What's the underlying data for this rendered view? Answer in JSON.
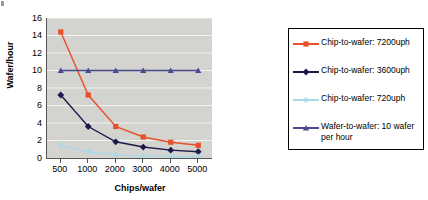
{
  "chart_data": {
    "type": "line",
    "title": "",
    "xlabel": "Chips/wafer",
    "ylabel": "Wafer/hour",
    "categories": [
      "500",
      "1000",
      "2000",
      "3000",
      "4000",
      "5000"
    ],
    "ylim": [
      0,
      16
    ],
    "yticks": [
      "0",
      "2",
      "4",
      "6",
      "8",
      "10",
      "12",
      "14",
      "16"
    ],
    "grid": true,
    "legend_position": "right",
    "series": [
      {
        "name": "Chip-to-wafer: 7200uph",
        "color": "#E8502A",
        "marker": "square",
        "values": [
          14.4,
          7.2,
          3.6,
          2.4,
          1.8,
          1.45
        ]
      },
      {
        "name": "Chip-to-wafer: 3600uph",
        "color": "#1B1B4B",
        "marker": "diamond",
        "values": [
          7.2,
          3.6,
          1.85,
          1.25,
          0.9,
          0.72
        ]
      },
      {
        "name": "Chip-to-wafer: 720uph",
        "color": "#A8D9E8",
        "marker": "star",
        "values": [
          1.45,
          0.72,
          0.36,
          0.24,
          0.18,
          0.15
        ]
      },
      {
        "name": "Wafer-to-wafer: 10 wafer per hour",
        "color": "#4A4A8C",
        "marker": "triangle",
        "values": [
          10,
          10,
          10,
          10,
          10,
          10
        ]
      }
    ]
  }
}
